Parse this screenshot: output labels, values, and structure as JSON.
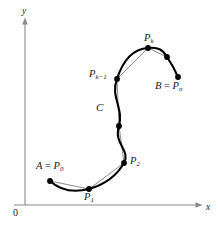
{
  "figure": {
    "background_color": "#fefefe",
    "width": 220,
    "height": 232,
    "curve_color": "#000000",
    "chord_color": "#8c8c8c",
    "axis_color": "#8a8a8a",
    "label_color": "#1a1a1a"
  },
  "axes": {
    "origin_label": "0",
    "x_label": "x",
    "y_label": "y",
    "origin_px": {
      "x": 25,
      "y": 205
    },
    "x_axis_end_px": {
      "x": 202,
      "y": 205
    },
    "y_axis_end_px": {
      "x": 25,
      "y": 19
    }
  },
  "labels": {
    "start_point": {
      "base": "A",
      "equals": " = ",
      "p": "P",
      "sub": "0"
    },
    "end_point": {
      "base": "B",
      "equals": " = ",
      "p": "P",
      "sub": "n"
    },
    "p1": {
      "p": "P",
      "sub": "1"
    },
    "p2": {
      "p": "P",
      "sub": "2"
    },
    "pk": {
      "p": "P",
      "sub": "k"
    },
    "pkm1": {
      "p": "P",
      "sub": "k−1"
    },
    "curve": "C"
  },
  "chart_data": {
    "type": "scatter",
    "xlabel": "x",
    "ylabel": "y",
    "grid": false,
    "legend": null,
    "annotations": [
      "A = P_0",
      "P_1",
      "P_2",
      "C",
      "P_k-1",
      "P_k",
      "B = P_n",
      "0",
      "x",
      "y"
    ],
    "points_px": [
      {
        "name": "A = P_0",
        "x": 50,
        "y": 181
      },
      {
        "name": "P_1",
        "x": 89,
        "y": 189
      },
      {
        "name": "P_2",
        "x": 124,
        "y": 163
      },
      {
        "name": "mid",
        "x": 119,
        "y": 126
      },
      {
        "name": "P_k-1",
        "x": 117,
        "y": 79
      },
      {
        "name": "P_k",
        "x": 148,
        "y": 48
      },
      {
        "name": "near-B",
        "x": 167,
        "y": 57
      },
      {
        "name": "B = P_n",
        "x": 178,
        "y": 77
      }
    ],
    "curve_path": "M50,181 C62,192 77,192 89,189 C103,185 116,177 124,163 C131,150 113,144 119,126 C124,109 110,96 117,79 C123,60 133,49 148,48 C159,47 163,50 167,57 C172,64 175,70 178,77",
    "chord_path": "M50,181 L89,189 L124,163 L119,126 L117,79 L148,48 L167,57 L178,77"
  }
}
